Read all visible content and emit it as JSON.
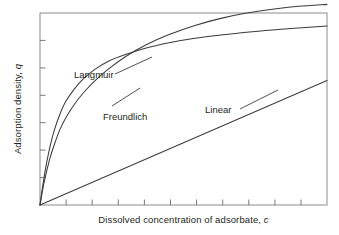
{
  "chart_data": {
    "type": "line",
    "title": "",
    "subtitle": "",
    "xlabel_text": "Dissolved concentration of adsorbate, ",
    "xlabel_var": "c",
    "ylabel_text": "Adsorption density, ",
    "ylabel_var": "q",
    "xlim": [
      0,
      1
    ],
    "ylim": [
      0,
      1
    ],
    "grid": false,
    "axis_tick_labels_shown": false,
    "x_tick_count": 10,
    "y_tick_count": 6,
    "tick_direction": "inward",
    "legend_position": "inline-annotations",
    "line_color": "#3b3b3b",
    "frame_color": "#888888",
    "background_color": "#ffffff",
    "series": [
      {
        "name": "Langmuir",
        "equation_form": "q = qmax*b*c/(1+b*c)",
        "annotation": "Langmuir",
        "annotation_x": 0.115,
        "annotation_y": 0.66,
        "x": [
          0,
          0.01,
          0.02,
          0.035,
          0.05,
          0.07,
          0.09,
          0.12,
          0.15,
          0.19,
          0.24,
          0.3,
          0.37,
          0.45,
          0.54,
          0.63,
          0.72,
          0.81,
          0.9,
          1.0
        ],
        "values": [
          0,
          0.105,
          0.195,
          0.305,
          0.39,
          0.475,
          0.54,
          0.605,
          0.655,
          0.705,
          0.75,
          0.785,
          0.818,
          0.845,
          0.868,
          0.885,
          0.9,
          0.912,
          0.922,
          0.932
        ]
      },
      {
        "name": "Freundlich",
        "equation_form": "q = K*c^(1/n)",
        "annotation": "Freundlich",
        "annotation_x": 0.215,
        "annotation_y": 0.45,
        "x": [
          0,
          0.01,
          0.02,
          0.035,
          0.05,
          0.07,
          0.09,
          0.12,
          0.15,
          0.19,
          0.24,
          0.3,
          0.37,
          0.45,
          0.54,
          0.63,
          0.72,
          0.81,
          0.9,
          1.0
        ],
        "values": [
          0,
          0.085,
          0.155,
          0.245,
          0.315,
          0.395,
          0.455,
          0.525,
          0.582,
          0.645,
          0.71,
          0.775,
          0.835,
          0.888,
          0.935,
          0.972,
          1.0,
          1.02,
          1.035,
          1.045
        ]
      },
      {
        "name": "Linear",
        "equation_form": "q = Kd*c",
        "annotation": "Linear",
        "annotation_x": 0.565,
        "annotation_y": 0.435,
        "x": [
          0,
          1.0
        ],
        "values": [
          0,
          0.648
        ]
      }
    ],
    "annotations": [
      {
        "label": "Langmuir",
        "leader_line": true
      },
      {
        "label": "Freundlich",
        "leader_line": true
      },
      {
        "label": "Linear",
        "leader_line": true
      }
    ]
  }
}
